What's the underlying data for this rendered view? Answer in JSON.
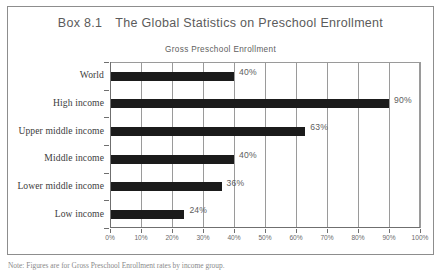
{
  "box": {
    "label": "Box 8.1",
    "title": "The Global Statistics on Preschool Enrollment"
  },
  "chart_data": {
    "type": "bar",
    "orientation": "horizontal",
    "title": "Gross Preschool Enrollment",
    "xlabel": "",
    "ylabel": "",
    "xlim": [
      0,
      100
    ],
    "grid": true,
    "legend": false,
    "categories": [
      "World",
      "High income",
      "Upper middle income",
      "Middle income",
      "Lower middle income",
      "Low income"
    ],
    "values": [
      40,
      90,
      63,
      40,
      36,
      24
    ],
    "value_labels": [
      "40%",
      "90%",
      "63%",
      "40%",
      "36%",
      "24%"
    ],
    "xticks": [
      0,
      10,
      20,
      30,
      40,
      50,
      60,
      70,
      80,
      90,
      100
    ],
    "xtick_labels": [
      "0%",
      "10%",
      "20%",
      "30%",
      "40%",
      "50%",
      "60%",
      "70%",
      "80%",
      "90%",
      "100%"
    ]
  },
  "footnote": {
    "text": "Note: Figures are for Gross Preschool Enrollment rates by income group."
  },
  "colors": {
    "bar": "#1b1b1b",
    "grid": "#9a9a9a",
    "axis": "#6f6f6f",
    "frame": "#8d8d8d",
    "title_text": "#5b5b5b",
    "category_text": "#3c3c3c",
    "value_text": "#5e5e5e"
  }
}
